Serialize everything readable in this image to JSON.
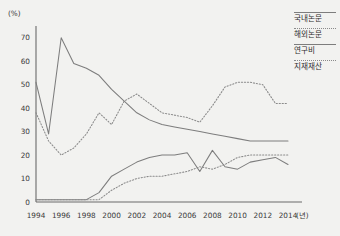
{
  "chart_data": {
    "type": "line",
    "title": "",
    "xlabel": "년",
    "ylabel": "%",
    "ylim": [
      0,
      75
    ],
    "xlim": [
      1994,
      2014
    ],
    "grid": false,
    "legend_position": "right",
    "y_ticks": [
      0,
      10,
      20,
      30,
      40,
      50,
      60,
      70
    ],
    "x_ticks": [
      1994,
      1996,
      1998,
      2000,
      2002,
      2004,
      2006,
      2008,
      2010,
      2012,
      2014
    ],
    "x": [
      1994,
      1995,
      1996,
      1997,
      1998,
      1999,
      2000,
      2001,
      2002,
      2003,
      2004,
      2005,
      2006,
      2007,
      2008,
      2009,
      2010,
      2011,
      2012,
      2013,
      2014
    ],
    "series": [
      {
        "name": "국내논문",
        "style": "solid",
        "color": "#7d7d7d",
        "values": [
          51,
          29,
          70,
          59,
          57,
          54,
          48,
          43,
          38,
          35,
          33,
          32,
          31,
          30,
          29,
          28,
          27,
          26,
          26,
          26,
          26
        ]
      },
      {
        "name": "해외논문",
        "style": "dotted",
        "color": "#8a8a8a",
        "values": [
          38,
          26,
          20,
          23,
          29,
          38,
          33,
          43,
          46,
          42,
          38,
          37,
          36,
          34,
          41,
          49,
          51,
          51,
          50,
          42,
          42
        ]
      },
      {
        "name": "연구비",
        "style": "solid",
        "color": "#7d7d7d",
        "values": [
          1,
          1,
          1,
          1,
          1,
          4,
          11,
          14,
          17,
          19,
          20,
          20,
          21,
          13,
          22,
          15,
          14,
          17,
          18,
          19,
          16
        ]
      },
      {
        "name": "지재재산",
        "style": "dotted",
        "color": "#8a8a8a",
        "values": [
          1,
          1,
          1,
          1,
          1,
          1,
          5,
          8,
          10,
          11,
          11,
          12,
          13,
          15,
          14,
          16,
          19,
          20,
          20,
          20,
          20
        ]
      }
    ]
  },
  "legend": {
    "items": [
      {
        "label": "국내논문",
        "style": "solid"
      },
      {
        "label": "해외논문",
        "style": "dotted"
      },
      {
        "label": "연구비",
        "style": "solid"
      },
      {
        "label": "지재재산",
        "style": "dotted"
      }
    ]
  }
}
